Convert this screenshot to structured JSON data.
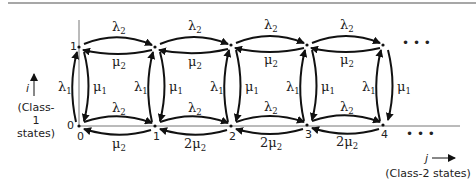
{
  "diagram": {
    "type": "state-transition diagram",
    "top_rule_color": "#8a8a8a",
    "edge_color": "#111111",
    "axis_color": "#777777",
    "rows": [
      {
        "i": 1,
        "label": "1"
      },
      {
        "i": 0,
        "label": "0"
      }
    ],
    "columns": [
      {
        "j": 0,
        "label": "0"
      },
      {
        "j": 1,
        "label": "1"
      },
      {
        "j": 2,
        "label": "2"
      },
      {
        "j": 3,
        "label": "3"
      },
      {
        "j": 4,
        "label": "4"
      }
    ],
    "ellipsis": "• • •",
    "y_axis": {
      "var": "i",
      "caption_line1": "(Class-1",
      "caption_line2": "states)"
    },
    "x_axis": {
      "var": "j",
      "caption": "(Class-2 states)"
    },
    "top_row_edges": [
      {
        "from": "(1,0)",
        "to": "(1,1)",
        "forward": "λ2",
        "backward": "μ2"
      },
      {
        "from": "(1,1)",
        "to": "(1,2)",
        "forward": "λ2",
        "backward": "μ2"
      },
      {
        "from": "(1,2)",
        "to": "(1,3)",
        "forward": "λ2",
        "backward": "μ2"
      },
      {
        "from": "(1,3)",
        "to": "(1,4)",
        "forward": "λ2",
        "backward": "μ2"
      }
    ],
    "bottom_row_edges": [
      {
        "from": "(0,0)",
        "to": "(0,1)",
        "forward": "λ2",
        "backward": "μ2"
      },
      {
        "from": "(0,1)",
        "to": "(0,2)",
        "forward": "λ2",
        "backward": "2μ2"
      },
      {
        "from": "(0,2)",
        "to": "(0,3)",
        "forward": "λ2",
        "backward": "2μ2"
      },
      {
        "from": "(0,3)",
        "to": "(0,4)",
        "forward": "λ2",
        "backward": "2μ2"
      }
    ],
    "vertical_edges": [
      {
        "column": 0,
        "up": "λ1",
        "down": "μ1"
      },
      {
        "column": 1,
        "up": "λ1",
        "down": "μ1"
      },
      {
        "column": 2,
        "up": "λ1",
        "down": "μ1"
      },
      {
        "column": 3,
        "up": "λ1",
        "down": "μ1"
      },
      {
        "column": 4,
        "up": "λ1",
        "down": "μ1"
      }
    ],
    "symbols": {
      "lambda": "λ",
      "mu": "μ",
      "sub1": "1",
      "sub2": "2",
      "two": "2"
    }
  }
}
